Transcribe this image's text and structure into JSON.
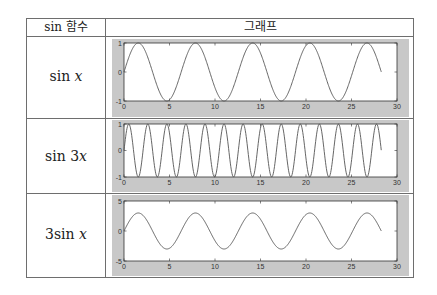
{
  "table": {
    "headers": [
      "sin 함수",
      "그래프"
    ],
    "rows": [
      {
        "label_prefix": "sin ",
        "label_var": "x",
        "label_coef_before": "",
        "label_coef": ""
      },
      {
        "label_prefix": "sin ",
        "label_var": "x",
        "label_coef_before": "",
        "label_coef": "3"
      },
      {
        "label_prefix": "sin ",
        "label_var": "x",
        "label_coef_before": "3",
        "label_coef": ""
      }
    ]
  },
  "chart_data": [
    {
      "type": "line",
      "title": "sin x",
      "function": "sin(x)",
      "x_range": [
        0,
        28.27
      ],
      "xlim": [
        0,
        30
      ],
      "ylim": [
        -1,
        1
      ],
      "xticks": [
        "0",
        "5",
        "10",
        "15",
        "20",
        "25",
        "30"
      ],
      "yticks": [
        "-1",
        "0",
        "1"
      ],
      "amplitude": 1,
      "frequency": 1,
      "grid": false
    },
    {
      "type": "line",
      "title": "sin 3x",
      "function": "sin(3x)",
      "x_range": [
        0,
        28.27
      ],
      "xlim": [
        0,
        30
      ],
      "ylim": [
        -1,
        1
      ],
      "xticks": [
        "0",
        "5",
        "10",
        "15",
        "20",
        "25",
        "30"
      ],
      "yticks": [
        "-1",
        "0",
        "1"
      ],
      "amplitude": 1,
      "frequency": 3,
      "grid": false
    },
    {
      "type": "line",
      "title": "3sin x",
      "function": "3*sin(x)",
      "x_range": [
        0,
        28.27
      ],
      "xlim": [
        0,
        30
      ],
      "ylim": [
        -5,
        5
      ],
      "xticks": [
        "0",
        "5",
        "10",
        "15",
        "20",
        "25",
        "30"
      ],
      "yticks": [
        "-5",
        "0",
        "5"
      ],
      "amplitude": 3,
      "frequency": 1,
      "grid": false
    }
  ],
  "colors": {
    "panel_bg": "#c8c8c8",
    "plot_bg": "#ffffff",
    "line": "#555555",
    "border": "#6e6e6e"
  }
}
